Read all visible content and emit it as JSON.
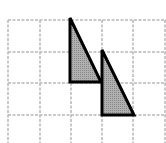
{
  "diagram": {
    "type": "grid-with-triangles",
    "background": "#ffffff",
    "grid": {
      "line_color": "#b8b8b8",
      "line_style": "dashed",
      "vertical_lines_x": [
        8,
        40,
        71,
        102,
        133,
        165
      ],
      "horizontal_lines_y": [
        20,
        52,
        83,
        115
      ],
      "extent": {
        "x0": 8,
        "y0": 20,
        "x1": 166,
        "y1": 143
      }
    },
    "shapes": [
      {
        "name": "triangle-1",
        "points": [
          [
            70,
            18
          ],
          [
            70,
            82
          ],
          [
            101,
            82
          ]
        ],
        "fill": "#a9a9a9",
        "stroke": "#000000",
        "stroke_width": 3
      },
      {
        "name": "triangle-2",
        "points": [
          [
            102,
            50
          ],
          [
            102,
            115
          ],
          [
            134,
            115
          ]
        ],
        "fill": "#a9a9a9",
        "stroke": "#000000",
        "stroke_width": 3
      }
    ]
  }
}
